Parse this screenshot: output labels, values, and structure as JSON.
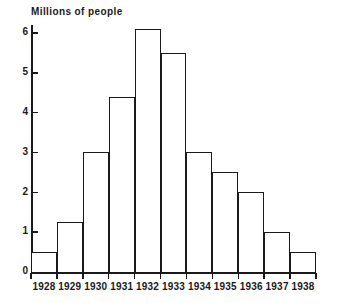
{
  "chart_data": {
    "type": "bar",
    "title": "Millions of people",
    "xlabel": "",
    "ylabel": "Millions of people",
    "categories": [
      "1928",
      "1929",
      "1930",
      "1931",
      "1932",
      "1933",
      "1934",
      "1935",
      "1936",
      "1937",
      "1938"
    ],
    "values": [
      0.5,
      1.25,
      3.0,
      4.4,
      6.1,
      5.5,
      3.0,
      2.5,
      2.0,
      1.0,
      0.5
    ],
    "ylim": [
      0,
      6.2
    ],
    "ytick_labels": [
      "6",
      "5",
      "4",
      "3",
      "2",
      "1",
      "0"
    ],
    "ytick_values": [
      6,
      5,
      4,
      3,
      2,
      1,
      0
    ],
    "grid": false,
    "legend": null,
    "bar_style": "outline",
    "colors": {
      "line": "#1a1a1a",
      "fill": "#ffffff",
      "background": "#ffffff"
    }
  }
}
